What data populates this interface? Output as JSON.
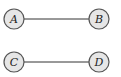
{
  "graph": {
    "nodes": [
      {
        "id": "A",
        "label": "A",
        "x": 14,
        "y": 19
      },
      {
        "id": "B",
        "label": "B",
        "x": 99,
        "y": 19
      },
      {
        "id": "C",
        "label": "C",
        "x": 14,
        "y": 62
      },
      {
        "id": "D",
        "label": "D",
        "x": 99,
        "y": 62
      }
    ],
    "edges": [
      {
        "from": "A",
        "to": "B"
      },
      {
        "from": "C",
        "to": "D"
      }
    ],
    "colors": {
      "node_fill": "#e6e6e6",
      "node_stroke": "#555555",
      "edge": "#333333"
    }
  }
}
